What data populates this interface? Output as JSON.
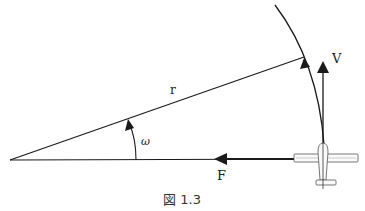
{
  "diagram": {
    "caption": "図 1.3",
    "labels": {
      "radius": "r",
      "angular_velocity": "ω",
      "velocity": "V",
      "force": "F"
    },
    "elements": [
      {
        "id": "radius-line",
        "type": "line",
        "description": "radius r from center to point on arc"
      },
      {
        "id": "base-line",
        "type": "line",
        "description": "horizontal line from center to airplane"
      },
      {
        "id": "arc",
        "type": "arc",
        "description": "circular flight path with direction arrow"
      },
      {
        "id": "omega-arc",
        "type": "arc-arrow",
        "description": "angular rotation ω"
      },
      {
        "id": "velocity-vector",
        "type": "arrow",
        "direction": "up",
        "label": "V"
      },
      {
        "id": "force-vector",
        "type": "arrow",
        "direction": "left",
        "label": "F"
      },
      {
        "id": "airplane",
        "type": "icon",
        "description": "top-view airplane at end of radius"
      }
    ],
    "colors": {
      "stroke": "#1a1a1a",
      "background": "#ffffff"
    }
  }
}
